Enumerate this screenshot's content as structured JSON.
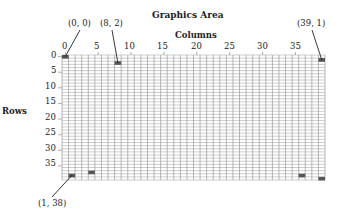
{
  "title": "Graphics Area",
  "columns_label": "Columns",
  "rows_label": "Rows",
  "grid": {
    "cols": 40,
    "rows": 40
  },
  "col_ticks": [
    "0",
    "5",
    "10",
    "15",
    "20",
    "25",
    "30",
    "35"
  ],
  "row_ticks": [
    "0",
    "5",
    "10",
    "15",
    "20",
    "25",
    "30",
    "35"
  ],
  "annotations": [
    {
      "label": "(0, 0)",
      "col": 0,
      "row": 0
    },
    {
      "label": "(8, 2)",
      "col": 8,
      "row": 2
    },
    {
      "label": "(39, 1)",
      "col": 39,
      "row": 1
    },
    {
      "label": "(1, 38)",
      "col": 1,
      "row": 38
    }
  ],
  "filled_cells": [
    {
      "col": 0,
      "row": 0
    },
    {
      "col": 8,
      "row": 2
    },
    {
      "col": 39,
      "row": 1
    },
    {
      "col": 1,
      "row": 38
    },
    {
      "col": 4,
      "row": 37
    },
    {
      "col": 36,
      "row": 38
    },
    {
      "col": 39,
      "row": 39
    }
  ],
  "colors": {
    "grid": "#9a9a9a",
    "fill": "#555555",
    "text": "#222222"
  }
}
